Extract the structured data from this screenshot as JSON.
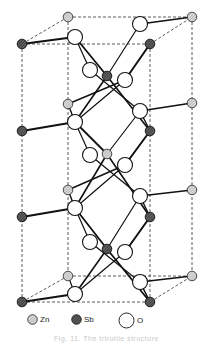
{
  "figure": {
    "caption": "Fig. 11. The trirutile structure",
    "colors": {
      "background": "#ffffff",
      "line": "#111111",
      "dashed": "#333333",
      "zn_fill": "#b8b8b8",
      "sb_fill": "#555555",
      "o_fill": "#ffffff"
    }
  },
  "legend": {
    "items": [
      {
        "symbol": "hatched-light-circle",
        "label": "Zn"
      },
      {
        "symbol": "hatched-dark-circle",
        "label": "Sb"
      },
      {
        "symbol": "open-circle",
        "label": "O"
      }
    ]
  },
  "atoms": {
    "zn": [
      [
        68,
        17
      ],
      [
        192,
        17
      ],
      [
        68,
        104
      ],
      [
        192,
        103
      ],
      [
        68,
        190
      ],
      [
        192,
        190
      ],
      [
        68,
        276
      ],
      [
        192,
        276
      ],
      [
        107,
        154
      ]
    ],
    "sb": [
      [
        22,
        44
      ],
      [
        150,
        44
      ],
      [
        107,
        76
      ],
      [
        22,
        131
      ],
      [
        150,
        131
      ],
      [
        22,
        217
      ],
      [
        150,
        217
      ],
      [
        107,
        249
      ],
      [
        150,
        302
      ],
      [
        22,
        302
      ]
    ],
    "o": [
      [
        75,
        37
      ],
      [
        140,
        24
      ],
      [
        90,
        70
      ],
      [
        125,
        80
      ],
      [
        75,
        122
      ],
      [
        140,
        111
      ],
      [
        90,
        155
      ],
      [
        125,
        165
      ],
      [
        75,
        208
      ],
      [
        140,
        196
      ],
      [
        90,
        242
      ],
      [
        125,
        252
      ],
      [
        75,
        294
      ],
      [
        140,
        282
      ]
    ]
  }
}
